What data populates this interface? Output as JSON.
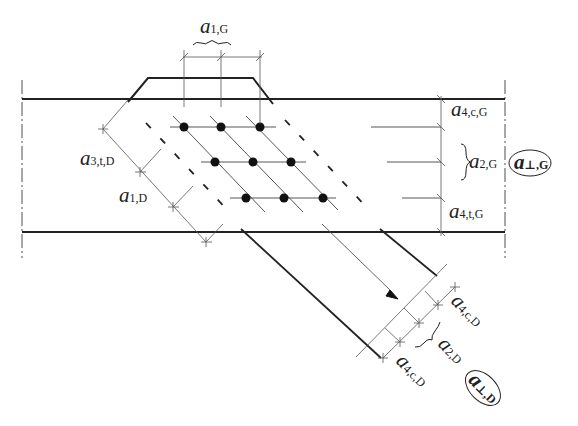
{
  "diagram": {
    "type": "connection-spacing-diagram",
    "chord": {
      "name": "G",
      "top_y": 99,
      "bottom_y": 232
    },
    "diagonal": {
      "name": "D"
    },
    "labels": {
      "a1G": {
        "main": "a",
        "sub": "1,G"
      },
      "a4cG": {
        "main": "a",
        "sub": "4,c,G"
      },
      "a2G": {
        "main": "a",
        "sub": "2,G"
      },
      "aperpG": {
        "main": "a",
        "sub": "⊥,G"
      },
      "a4tG": {
        "main": "a",
        "sub": "4,t,G"
      },
      "a3tD": {
        "main": "a",
        "sub": "3,t,D"
      },
      "a1D": {
        "main": "a",
        "sub": "1,D"
      },
      "a4cD_top": {
        "main": "a",
        "sub": "4,c,D"
      },
      "a2D": {
        "main": "a",
        "sub": "2,D"
      },
      "a4cD_bottom": {
        "main": "a",
        "sub": "4,c,D"
      },
      "aperpD": {
        "main": "a",
        "sub": "⊥,D"
      }
    },
    "fasteners": {
      "rows": 3,
      "cols": 3
    },
    "colors": {
      "line": "#222222",
      "thin": "#555555",
      "background": "#ffffff"
    }
  }
}
